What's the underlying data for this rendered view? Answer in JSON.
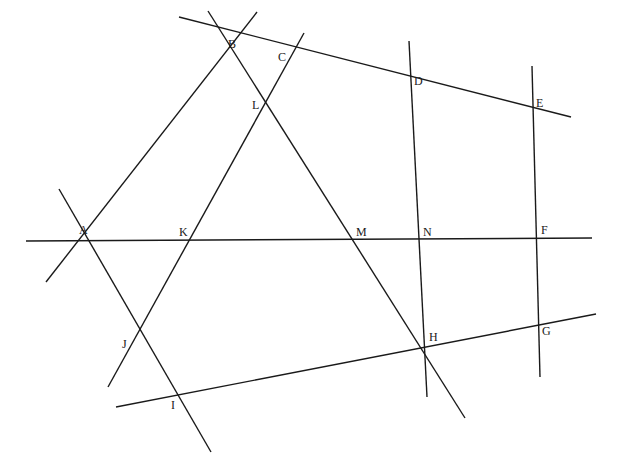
{
  "canvas": {
    "width": 621,
    "height": 463,
    "background": "#ffffff",
    "stroke": "#1a1a1a"
  },
  "lines": [
    {
      "id": "line-AKMNF",
      "x1": 26,
      "y1": 241,
      "x2": 592,
      "y2": 238
    },
    {
      "id": "line-BCDE",
      "x1": 179,
      "y1": 17,
      "x2": 571,
      "y2": 117
    },
    {
      "id": "line-AB",
      "x1": 46,
      "y1": 282,
      "x2": 257,
      "y2": 12
    },
    {
      "id": "line-BLMH",
      "x1": 208,
      "y1": 11,
      "x2": 465,
      "y2": 418
    },
    {
      "id": "line-CLKJ",
      "x1": 304,
      "y1": 33,
      "x2": 108,
      "y2": 387
    },
    {
      "id": "line-AJI",
      "x1": 59,
      "y1": 189,
      "x2": 211,
      "y2": 452
    },
    {
      "id": "line-DNH",
      "x1": 409,
      "y1": 41,
      "x2": 427,
      "y2": 397
    },
    {
      "id": "line-EFG",
      "x1": 532,
      "y1": 66,
      "x2": 540,
      "y2": 377
    },
    {
      "id": "line-IHG",
      "x1": 116,
      "y1": 407,
      "x2": 596,
      "y2": 314
    }
  ],
  "points": [
    {
      "label": "A",
      "x": 83,
      "y": 239,
      "lx": 79,
      "ly": 234
    },
    {
      "label": "B",
      "x": 232,
      "y": 54,
      "lx": 228,
      "ly": 48
    },
    {
      "label": "C",
      "x": 288,
      "y": 63,
      "lx": 278,
      "ly": 61
    },
    {
      "label": "D",
      "x": 412,
      "y": 87,
      "lx": 414,
      "ly": 85
    },
    {
      "label": "E",
      "x": 533,
      "y": 110,
      "lx": 536,
      "ly": 107
    },
    {
      "label": "F",
      "x": 537,
      "y": 238,
      "lx": 541,
      "ly": 234
    },
    {
      "label": "G",
      "x": 538,
      "y": 324,
      "lx": 542,
      "ly": 335
    },
    {
      "label": "H",
      "x": 425,
      "y": 347,
      "lx": 429,
      "ly": 341
    },
    {
      "label": "I",
      "x": 162,
      "y": 396,
      "lx": 171,
      "ly": 409
    },
    {
      "label": "J",
      "x": 134,
      "y": 342,
      "lx": 122,
      "ly": 348
    },
    {
      "label": "K",
      "x": 190,
      "y": 239,
      "lx": 179,
      "ly": 236
    },
    {
      "label": "L",
      "x": 265,
      "y": 104,
      "lx": 252,
      "ly": 109
    },
    {
      "label": "M",
      "x": 354,
      "y": 239,
      "lx": 356,
      "ly": 236
    },
    {
      "label": "N",
      "x": 420,
      "y": 239,
      "lx": 423,
      "ly": 236
    }
  ]
}
